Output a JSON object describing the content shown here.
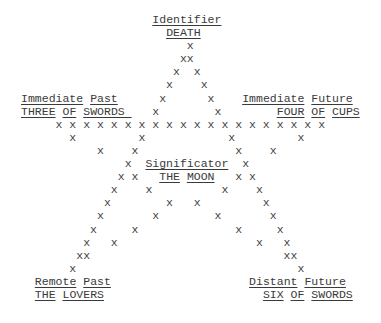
{
  "positions": {
    "top": {
      "role": "Identifier",
      "card": "DEATH"
    },
    "upper_left": {
      "role": "Immediate Past",
      "card": "THREE OF SWORDS"
    },
    "upper_right": {
      "role": "Immediate Future",
      "card": "FOUR OF CUPS"
    },
    "center": {
      "role": "Significator",
      "card": "THE MOON"
    },
    "lower_left": {
      "role": "Remote Past",
      "card": "THE LOVERS"
    },
    "lower_right": {
      "role": "Distant Future",
      "card": "SIX OF SWORDS"
    }
  },
  "mark_glyph": "x",
  "lines": [
    [
      {
        "t": "                   "
      },
      {
        "t": "Identifier",
        "u": true,
        "name": "label-identifier"
      }
    ],
    [
      {
        "t": "                     "
      },
      {
        "t": "DEATH",
        "u": true,
        "name": "card-death"
      }
    ],
    [
      {
        "t": "                        x",
        "m": true
      }
    ],
    [
      {
        "t": "                       xx",
        "m": true
      }
    ],
    [
      {
        "t": "                      x  x",
        "m": true
      }
    ],
    [
      {
        "t": "                     x    x",
        "m": true
      }
    ],
    [
      {
        "t": "Immediate",
        "u": true,
        "name": "label-immediate-past"
      },
      {
        "t": " "
      },
      {
        "t": "Past",
        "u": true,
        "name": "label-immediate-past"
      },
      {
        "t": "      x      x    ",
        "m": true
      },
      {
        "t": "Immediate",
        "u": true,
        "name": "label-immediate-future"
      },
      {
        "t": " "
      },
      {
        "t": "Future",
        "u": true,
        "name": "label-immediate-future"
      }
    ],
    [
      {
        "t": "THREE",
        "u": true,
        "name": "card-three-of-swords"
      },
      {
        "t": " "
      },
      {
        "t": "OF",
        "u": true,
        "name": "card-three-of-swords"
      },
      {
        "t": " "
      },
      {
        "t": "SWORDS ",
        "u": true,
        "name": "card-three-of-swords"
      },
      {
        "t": "   x        x        ",
        "m": true
      },
      {
        "t": "FOUR",
        "u": true,
        "name": "card-four-of-cups"
      },
      {
        "t": " "
      },
      {
        "t": "OF",
        "u": true,
        "name": "card-four-of-cups"
      },
      {
        "t": " "
      },
      {
        "t": "CUPS",
        "u": true,
        "name": "card-four-of-cups"
      }
    ],
    [
      {
        "t": "     x x x x x x x x x x x x x x x x x x x x",
        "m": true
      }
    ],
    [
      {
        "t": "       x         x            x         x",
        "m": true
      }
    ],
    [
      {
        "t": "           x    x              x    x",
        "m": true
      }
    ],
    [
      {
        "t": "               x  ",
        "m": true
      },
      {
        "t": "Significator",
        "u": true,
        "name": "label-significator"
      },
      {
        "t": "  x",
        "m": true
      }
    ],
    [
      {
        "t": "              x x   ",
        "m": true
      },
      {
        "t": "THE",
        "u": true,
        "name": "card-the-moon"
      },
      {
        "t": " "
      },
      {
        "t": "MOON",
        "u": true,
        "name": "card-the-moon"
      },
      {
        "t": "   x x",
        "m": true
      }
    ],
    [
      {
        "t": "             x    x          x    x",
        "m": true
      }
    ],
    [
      {
        "t": "            x        x   x         x",
        "m": true
      }
    ],
    [
      {
        "t": "           x       x        x       x",
        "m": true
      }
    ],
    [
      {
        "t": "          x     x              x     x",
        "m": true
      }
    ],
    [
      {
        "t": "         x   x                    x   x",
        "m": true
      }
    ],
    [
      {
        "t": "        xx                            xx",
        "m": true
      }
    ],
    [
      {
        "t": "       x                                x",
        "m": true
      }
    ],
    [
      {
        "t": "  "
      },
      {
        "t": "Remote",
        "u": true,
        "name": "label-remote-past"
      },
      {
        "t": " "
      },
      {
        "t": "Past",
        "u": true,
        "name": "label-remote-past"
      },
      {
        "t": "                    "
      },
      {
        "t": "Distant",
        "u": true,
        "name": "label-distant-future"
      },
      {
        "t": " "
      },
      {
        "t": "Future",
        "u": true,
        "name": "label-distant-future"
      }
    ],
    [
      {
        "t": "  "
      },
      {
        "t": "THE",
        "u": true,
        "name": "card-the-lovers"
      },
      {
        "t": " "
      },
      {
        "t": "LOVERS",
        "u": true,
        "name": "card-the-lovers"
      },
      {
        "t": "                       "
      },
      {
        "t": "SIX",
        "u": true,
        "name": "card-six-of-swords"
      },
      {
        "t": " "
      },
      {
        "t": "OF",
        "u": true,
        "name": "card-six-of-swords"
      },
      {
        "t": " "
      },
      {
        "t": "SWORDS",
        "u": true,
        "name": "card-six-of-swords"
      }
    ]
  ]
}
